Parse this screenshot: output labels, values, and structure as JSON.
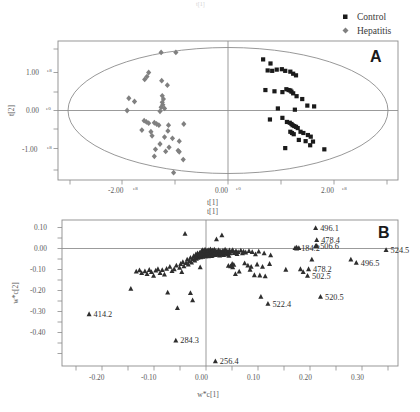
{
  "figure": {
    "top_faint_text": "t[1]",
    "background_color": "#ffffff"
  },
  "legend": {
    "items": [
      {
        "label": "Control",
        "marker": "square-marker",
        "color": "#1a1a1a"
      },
      {
        "label": "Hepatitis",
        "marker": "diamond-marker",
        "color": "#808080"
      }
    ]
  },
  "panel_a": {
    "letter": "A",
    "xlabel": "t[1]",
    "ylabel": "t[2]",
    "xticks": [
      {
        "mantissa": "-2.00",
        "exp": "e8"
      },
      {
        "mantissa": "0.00",
        "exp": "e0"
      },
      {
        "mantissa": "2.00",
        "exp": "e8"
      }
    ],
    "yticks": [
      {
        "mantissa": "1.00",
        "exp": "e8"
      },
      {
        "mantissa": "0.00",
        "exp": "e0"
      },
      {
        "mantissa": "-1.00",
        "exp": "e8"
      }
    ]
  },
  "panel_b": {
    "letter": "B",
    "xlabel": "w*c[1]",
    "ylabel": "w*c[2]",
    "xticks": [
      "-0.20",
      "-0.10",
      "0.00",
      "0.10",
      "0.20",
      "0.30"
    ],
    "yticks": [
      "0.10",
      "0.00",
      "-0.10",
      "-0.20",
      "-0.30",
      "-0.40"
    ]
  },
  "chart_data": [
    {
      "type": "scatter",
      "panel": "A",
      "title": "PLS-DA scores plot",
      "xlabel": "t[1]",
      "ylabel": "t[2]",
      "xlim": [
        -300000000,
        300000000
      ],
      "ylim": [
        -170000000,
        170000000
      ],
      "xticks": [
        -200000000,
        0,
        200000000
      ],
      "yticks": [
        -100000000,
        0,
        100000000
      ],
      "grid": false,
      "legend_position": "top-right",
      "annotations": [
        "Hotelling T2 95% confidence ellipse"
      ],
      "series": [
        {
          "name": "Control",
          "marker": "square",
          "color": "#1a1a1a",
          "points": [
            [
              62000000,
              125000000
            ],
            [
              75000000,
              115000000
            ],
            [
              70000000,
              98000000
            ],
            [
              78000000,
              97000000
            ],
            [
              86000000,
              100000000
            ],
            [
              95000000,
              101000000
            ],
            [
              101000000,
              97000000
            ],
            [
              110000000,
              95000000
            ],
            [
              115000000,
              90000000
            ],
            [
              120000000,
              86000000
            ],
            [
              66000000,
              50000000
            ],
            [
              82000000,
              47000000
            ],
            [
              96000000,
              45000000
            ],
            [
              103000000,
              52000000
            ],
            [
              107000000,
              50000000
            ],
            [
              110000000,
              49000000
            ],
            [
              112000000,
              46000000
            ],
            [
              115000000,
              42000000
            ],
            [
              121000000,
              35000000
            ],
            [
              131000000,
              28000000
            ],
            [
              140000000,
              12000000
            ],
            [
              152000000,
              10000000
            ],
            [
              88000000,
              5000000
            ],
            [
              118000000,
              2000000
            ],
            [
              96000000,
              -18000000
            ],
            [
              74000000,
              -22000000
            ],
            [
              104000000,
              -28000000
            ],
            [
              109000000,
              -30000000
            ],
            [
              112000000,
              -33000000
            ],
            [
              114000000,
              -36000000
            ],
            [
              117000000,
              -38000000
            ],
            [
              120000000,
              -40000000
            ],
            [
              123000000,
              -43000000
            ],
            [
              110000000,
              -52000000
            ],
            [
              113000000,
              -55000000
            ],
            [
              116000000,
              -58000000
            ],
            [
              128000000,
              -52000000
            ],
            [
              133000000,
              -55000000
            ],
            [
              141000000,
              -60000000
            ],
            [
              146000000,
              -64000000
            ],
            [
              125000000,
              -72000000
            ],
            [
              137000000,
              -75000000
            ],
            [
              150000000,
              -76000000
            ],
            [
              101000000,
              -92000000
            ],
            [
              170000000,
              -95000000
            ],
            [
              145000000,
              -85000000
            ]
          ]
        },
        {
          "name": "Hepatitis",
          "marker": "diamond",
          "color": "#808080",
          "points": [
            [
              -118000000,
              142000000
            ],
            [
              -92000000,
              142000000
            ],
            [
              -140000000,
              93000000
            ],
            [
              -143000000,
              83000000
            ],
            [
              -147000000,
              76000000
            ],
            [
              -117000000,
              73000000
            ],
            [
              -107000000,
              62000000
            ],
            [
              -175000000,
              30000000
            ],
            [
              -165000000,
              22000000
            ],
            [
              -116000000,
              36000000
            ],
            [
              -114000000,
              28000000
            ],
            [
              -116000000,
              20000000
            ],
            [
              -115000000,
              14000000
            ],
            [
              -118000000,
              8000000
            ],
            [
              -112000000,
              5000000
            ],
            [
              -178000000,
              0
            ],
            [
              -120000000,
              -2000000
            ],
            [
              -148000000,
              -25000000
            ],
            [
              -144000000,
              -28000000
            ],
            [
              -140000000,
              -31000000
            ],
            [
              -130000000,
              -30000000
            ],
            [
              -126000000,
              -33000000
            ],
            [
              -122000000,
              -36000000
            ],
            [
              -105000000,
              -36000000
            ],
            [
              -78000000,
              -33000000
            ],
            [
              -152000000,
              -48000000
            ],
            [
              -136000000,
              -52000000
            ],
            [
              -106000000,
              -50000000
            ],
            [
              -134000000,
              -62000000
            ],
            [
              -112000000,
              -65000000
            ],
            [
              -98000000,
              -68000000
            ],
            [
              -86000000,
              -75000000
            ],
            [
              -120000000,
              -82000000
            ],
            [
              -104000000,
              -90000000
            ],
            [
              -128000000,
              -95000000
            ],
            [
              -110000000,
              -100000000
            ],
            [
              -88000000,
              -98000000
            ],
            [
              -86000000,
              -101000000
            ],
            [
              -130000000,
              -112000000
            ],
            [
              -79000000,
              -120000000
            ],
            [
              -96000000,
              -152000000
            ]
          ]
        }
      ]
    },
    {
      "type": "scatter",
      "panel": "B",
      "title": "PLS-DA loadings plot",
      "xlabel": "w*c[1]",
      "ylabel": "w*c[2]",
      "xlim": [
        -0.265,
        0.355
      ],
      "ylim": [
        -0.475,
        0.135
      ],
      "xticks": [
        -0.2,
        -0.1,
        0,
        0.1,
        0.2,
        0.3
      ],
      "yticks": [
        0.1,
        0,
        -0.1,
        -0.2,
        -0.3,
        -0.4
      ],
      "grid": false,
      "marker": "triangle",
      "color": "#2e2e2e",
      "labeled_points": [
        {
          "label": "496.1",
          "x": 0.203,
          "y": 0.102
        },
        {
          "label": "478.4",
          "x": 0.205,
          "y": 0.052
        },
        {
          "label": "506.6",
          "x": 0.203,
          "y": 0.027
        },
        {
          "label": "524.5",
          "x": 0.333,
          "y": 0.01
        },
        {
          "label": "184.2",
          "x": 0.168,
          "y": 0.02
        },
        {
          "label": "478.2",
          "x": 0.19,
          "y": -0.07
        },
        {
          "label": "496.5",
          "x": 0.278,
          "y": -0.043
        },
        {
          "label": "502.5",
          "x": 0.188,
          "y": -0.098
        },
        {
          "label": "520.5",
          "x": 0.212,
          "y": -0.185
        },
        {
          "label": "522.4",
          "x": 0.115,
          "y": -0.215
        },
        {
          "label": "414.2",
          "x": -0.215,
          "y": -0.258
        },
        {
          "label": "284.3",
          "x": -0.055,
          "y": -0.368
        },
        {
          "label": "256.4",
          "x": 0.018,
          "y": -0.455
        }
      ],
      "unlabeled_points": [
        [
          -0.138,
          -0.152
        ],
        [
          -0.128,
          -0.08
        ],
        [
          -0.122,
          -0.075
        ],
        [
          -0.118,
          -0.086
        ],
        [
          -0.112,
          -0.079
        ],
        [
          -0.108,
          -0.09
        ],
        [
          -0.104,
          -0.073
        ],
        [
          -0.1,
          -0.082
        ],
        [
          -0.096,
          -0.098
        ],
        [
          -0.092,
          -0.076
        ],
        [
          -0.088,
          -0.07
        ],
        [
          -0.084,
          -0.086
        ],
        [
          -0.08,
          -0.074
        ],
        [
          -0.076,
          -0.092
        ],
        [
          -0.072,
          -0.068
        ],
        [
          -0.07,
          -0.168
        ],
        [
          -0.066,
          -0.06
        ],
        [
          -0.062,
          -0.078
        ],
        [
          -0.058,
          -0.07
        ],
        [
          -0.054,
          -0.055
        ],
        [
          -0.052,
          -0.232
        ],
        [
          -0.048,
          -0.064
        ],
        [
          -0.046,
          -0.048
        ],
        [
          -0.044,
          -0.082
        ],
        [
          -0.042,
          -0.04
        ],
        [
          -0.04,
          -0.058
        ],
        [
          -0.038,
          0.078
        ],
        [
          -0.036,
          -0.044
        ],
        [
          -0.034,
          -0.03
        ],
        [
          -0.032,
          -0.05
        ],
        [
          -0.03,
          -0.036
        ],
        [
          -0.028,
          -0.022
        ],
        [
          -0.028,
          -0.17
        ],
        [
          -0.026,
          -0.042
        ],
        [
          -0.024,
          -0.2
        ],
        [
          -0.024,
          -0.028
        ],
        [
          -0.022,
          -0.015
        ],
        [
          -0.02,
          -0.034
        ],
        [
          -0.019,
          -0.02
        ],
        [
          -0.018,
          -0.008
        ],
        [
          -0.017,
          -0.026
        ],
        [
          -0.016,
          -0.014
        ],
        [
          -0.015,
          -0.004
        ],
        [
          -0.014,
          -0.022
        ],
        [
          -0.013,
          -0.01
        ],
        [
          -0.012,
          -0.018
        ],
        [
          -0.011,
          -0.002
        ],
        [
          -0.01,
          -0.012
        ],
        [
          -0.01,
          -0.062
        ],
        [
          -0.009,
          -0.02
        ],
        [
          -0.008,
          0.004
        ],
        [
          -0.008,
          -0.014
        ],
        [
          -0.007,
          -0.006
        ],
        [
          -0.006,
          -0.016
        ],
        [
          -0.006,
          0.01
        ],
        [
          -0.005,
          -0.008
        ],
        [
          -0.005,
          -0.018
        ],
        [
          -0.004,
          0.002
        ],
        [
          -0.004,
          -0.012
        ],
        [
          -0.003,
          -0.004
        ],
        [
          -0.003,
          0.008
        ],
        [
          -0.002,
          -0.014
        ],
        [
          -0.002,
          0.0
        ],
        [
          -0.001,
          -0.008
        ],
        [
          -0.001,
          0.012
        ],
        [
          0.0,
          -0.004
        ],
        [
          0.0,
          -0.016
        ],
        [
          0.001,
          0.006
        ],
        [
          0.001,
          -0.01
        ],
        [
          0.002,
          0.0
        ],
        [
          0.002,
          -0.014
        ],
        [
          0.003,
          0.008
        ],
        [
          0.003,
          -0.006
        ],
        [
          0.004,
          -0.012
        ],
        [
          0.004,
          0.002
        ],
        [
          0.005,
          -0.002
        ],
        [
          0.005,
          -0.016
        ],
        [
          0.006,
          0.01
        ],
        [
          0.006,
          -0.008
        ],
        [
          0.007,
          0.0
        ],
        [
          0.007,
          -0.013
        ],
        [
          0.008,
          0.004
        ],
        [
          0.008,
          -0.005
        ],
        [
          0.009,
          -0.011
        ],
        [
          0.009,
          0.013
        ],
        [
          0.01,
          -0.002
        ],
        [
          0.01,
          -0.009
        ],
        [
          0.011,
          0.006
        ],
        [
          0.011,
          -0.015
        ],
        [
          0.012,
          0.001
        ],
        [
          0.012,
          -0.007
        ],
        [
          0.013,
          0.009
        ],
        [
          0.013,
          -0.012
        ],
        [
          0.014,
          -0.003
        ],
        [
          0.015,
          0.004
        ],
        [
          0.015,
          -0.009
        ],
        [
          0.016,
          -0.001
        ],
        [
          0.016,
          0.012
        ],
        [
          0.017,
          -0.006
        ],
        [
          0.018,
          0.002
        ],
        [
          0.018,
          -0.011
        ],
        [
          0.019,
          0.007
        ],
        [
          0.02,
          -0.004
        ],
        [
          0.02,
          0.055
        ],
        [
          0.021,
          -0.01
        ],
        [
          0.022,
          0.003
        ],
        [
          0.023,
          -0.007
        ],
        [
          0.024,
          0.01
        ],
        [
          0.025,
          -0.002
        ],
        [
          0.026,
          -0.013
        ],
        [
          0.027,
          0.005
        ],
        [
          0.028,
          -0.008
        ],
        [
          0.029,
          0.001
        ],
        [
          0.03,
          0.072
        ],
        [
          0.03,
          -0.005
        ],
        [
          0.032,
          0.008
        ],
        [
          0.033,
          -0.011
        ],
        [
          0.034,
          0.002
        ],
        [
          0.035,
          -0.006
        ],
        [
          0.036,
          0.012
        ],
        [
          0.038,
          -0.002
        ],
        [
          0.039,
          0.006
        ],
        [
          0.04,
          -0.009
        ],
        [
          0.041,
          0.001
        ],
        [
          0.042,
          -0.056
        ],
        [
          0.043,
          -0.014
        ],
        [
          0.044,
          0.009
        ],
        [
          0.045,
          -0.004
        ],
        [
          0.046,
          -0.058
        ],
        [
          0.048,
          0.004
        ],
        [
          0.049,
          -0.048
        ],
        [
          0.05,
          -0.062
        ],
        [
          0.05,
          0.01
        ],
        [
          0.052,
          -0.052
        ],
        [
          0.053,
          -0.002
        ],
        [
          0.055,
          -0.09
        ],
        [
          0.056,
          0.006
        ],
        [
          0.058,
          -0.007
        ],
        [
          0.06,
          0.002
        ],
        [
          0.062,
          -0.08
        ],
        [
          0.065,
          0.008
        ],
        [
          0.068,
          -0.004
        ],
        [
          0.07,
          0.004
        ],
        [
          0.072,
          -0.045
        ],
        [
          0.074,
          0.0
        ],
        [
          0.078,
          -0.055
        ],
        [
          0.08,
          0.006
        ],
        [
          0.082,
          -0.072
        ],
        [
          0.084,
          -0.06
        ],
        [
          0.086,
          0.002
        ],
        [
          0.09,
          -0.095
        ],
        [
          0.092,
          -0.008
        ],
        [
          0.095,
          -0.05
        ],
        [
          0.098,
          0.004
        ],
        [
          0.1,
          -0.096
        ],
        [
          0.102,
          -0.185
        ],
        [
          0.105,
          -0.06
        ],
        [
          0.108,
          -0.004
        ],
        [
          0.11,
          -0.1
        ],
        [
          0.118,
          -0.048
        ],
        [
          0.12,
          -0.012
        ],
        [
          0.148,
          -0.072
        ],
        [
          0.165,
          0.018
        ],
        [
          0.168,
          0.016
        ],
        [
          0.172,
          0.018
        ],
        [
          0.175,
          -0.07
        ],
        [
          0.18,
          -0.082
        ],
        [
          0.196,
          -0.03
        ],
        [
          0.205,
          0.028
        ],
        [
          0.268,
          -0.03
        ]
      ]
    }
  ]
}
